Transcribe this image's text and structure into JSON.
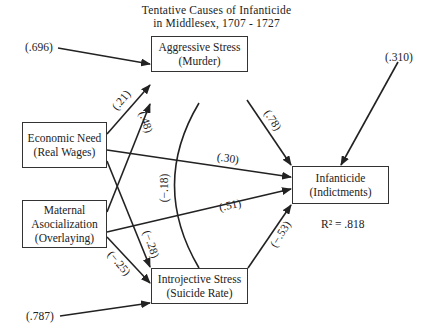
{
  "title": {
    "line1": "Tentative Causes of Infanticide",
    "line2": "in Middlesex, 1707 - 1727"
  },
  "nodes": {
    "aggressive": {
      "line1": "Aggressive Stress",
      "line2": "(Murder)"
    },
    "economic": {
      "line1": "Economic Need",
      "line2": "(Real Wages)"
    },
    "maternal": {
      "line1": "Maternal",
      "line2": "Asocialization",
      "line3": "(Overlaying)"
    },
    "introjective": {
      "line1": "Introjective Stress",
      "line2": "(Suicide Rate)"
    },
    "infanticide": {
      "line1": "Infanticide",
      "line2": "(Indictments)"
    }
  },
  "residuals": {
    "aggressive": "(.696)",
    "introjective": "(.787)",
    "infanticide": "(.310)"
  },
  "paths": {
    "economic_to_aggressive": "(.21)",
    "maternal_to_aggressive": "(.48)",
    "aggressive_to_infanticide": "(.78)",
    "economic_to_infanticide": "(.30)",
    "maternal_to_infanticide": "(.51)",
    "aggressive_introjective_corr": "(−.18)",
    "economic_to_introjective": "(−.28)",
    "maternal_to_introjective": "(−.25)",
    "introjective_to_infanticide": "(−.53)"
  },
  "r_squared": "R² = .818",
  "colors": {
    "line": "#222222",
    "box_border": "#333333",
    "background": "#ffffff"
  }
}
